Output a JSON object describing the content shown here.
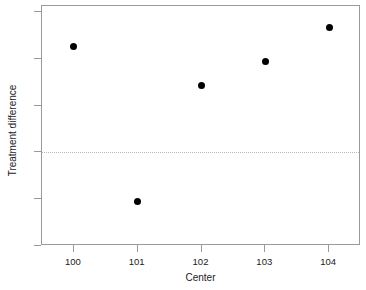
{
  "chart_data": {
    "type": "scatter",
    "title": "",
    "xlabel": "Center",
    "ylabel": "Treatment difference",
    "x": [
      100,
      101,
      102,
      103,
      104
    ],
    "values": [
      9.0,
      -4.2,
      5.7,
      7.8,
      10.7
    ],
    "series": [
      {
        "name": "Treatment difference",
        "points": [
          {
            "x": 100,
            "y": 9.0
          },
          {
            "x": 101,
            "y": -4.2
          },
          {
            "x": 102,
            "y": 5.7
          },
          {
            "x": 103,
            "y": 7.8
          },
          {
            "x": 104,
            "y": 10.7
          }
        ]
      }
    ],
    "xlim": [
      99.5,
      104.5
    ],
    "ylim": [
      -8.0,
      12.5
    ],
    "xticks": [
      100,
      101,
      102,
      103,
      104
    ],
    "xtick_labels": [
      "100",
      "101",
      "102",
      "103",
      "104"
    ],
    "yticks": [
      12,
      8,
      4,
      0,
      -4,
      -8
    ],
    "ytick_labels": [
      "12",
      "8",
      "4",
      "0",
      "-4",
      "-8"
    ],
    "grid": false,
    "legend": false,
    "reference_lines": [
      {
        "orientation": "horizontal",
        "value": 0,
        "style": "dotted",
        "color": "#b9b9b9"
      }
    ],
    "marker": {
      "shape": "circle",
      "filled": true,
      "color": "#000000",
      "size_px": 7
    },
    "frame_color": "#9a9a9a",
    "background": "#ffffff"
  }
}
